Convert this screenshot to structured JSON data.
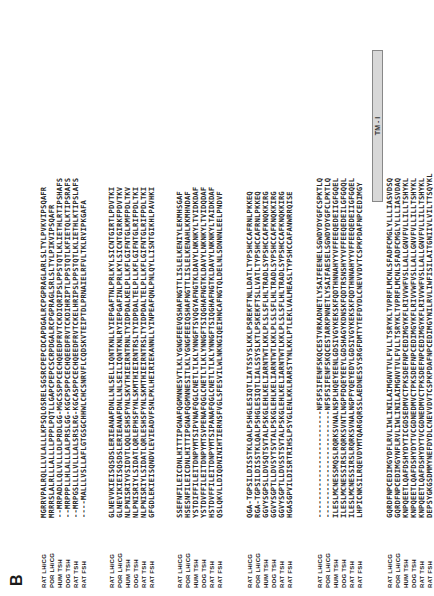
{
  "figure": {
    "panel_label": "B",
    "species": [
      "RAT LH/CG",
      "POR LH/CG",
      "HUM TSH",
      "DOG TSH",
      "RAT TSH",
      "RAT FSH"
    ],
    "annotation": {
      "tm1_label": "TM - I"
    },
    "blocks": [
      {
        "rows": [
          "MGRRVPALRQLLLVLALLLKPSQLOSRELSGSRCPEPCDCAPDGALRCPGPRAGLARLSLTYLPVKVIPSQAFR",
          "MRRRSLALRLLLALLLLPPPLPQTLLGAPCPEPCSCRPDGALRCPGPRAGLSRLSLTYLPIKVIPSQAFR",
          "--MRPADLLQLVLLLDLPRDLGG-MGCSSPPCECHQEEDFRVTCKDIQRIPSLPPSTQTLKLIETHLRTIPSHAFS",
          "--MRPPPLLHLALLLALPRSLGG-KGCPSPPCECHQEEDFRVTCKDIHRIPTLPPSTQTLKFIETQLKTIPSRAFS",
          "--MRPGSLLLLVLLLALSRSLRG-KGCASPPCECHQEEDFRVTCKELHRIPSLPPSTQTLKLIETHLKTIPSLAFS",
          "----MALLLVSLLAFLGTGSGCHHWLCHCSNRVFLCQDSKVTEIPTDLPRNAIELRFVLTKLRVIPKGAFA"
        ]
      },
      {
        "rows": [
          "GLNEVVKIEISQSDSLERIEANAFDNLLNLSELLIQNTKNLLYIEPGAFTNLPRLKYLSICNTGIRTLPDVTKI",
          "GLNEVIKIEISQSDSLERIEANAFDNLLNLSEILIQNTKNLRYIEPGAFINLPRLKYLSICNTGIRKFPDVTKV",
          "NLPNISRIYVSIDVTLQQLESHSFYNLSKVTHIEIRNTRNLTYIDPDALKELPLLKFLGIFNTGLKMFPDLTKV",
          "NLPNISRIYLSIDATLQRLEPHSFYNLSKMTHIEIRNTRSLTYIDPDALTELPLLKFLGIFNTGLRIFPDLTKI",
          "NLPNISRIYLSIDATLQRLESHSFYNLSKMTHIEIRNTRSLTYIDPDALTELPLLKFLGIFNTGLRIFPDLTKI",
          "GFGDLEKIEISQNDVLEVIEADVFSNLPKLHEIRIEKANNLLYINPEAFQNLPNLQYLLISNTGIKHLPAVHKI"
        ]
      },
      {
        "rows": [
          "SSEFNFILEICDNLHITTIPGNAFQGMNNESVTLKLYGNGFEEVQSHAFNGTTLISLELKENIYLEKMHSGAF",
          "HSESNFILEICDNLHITTIPGNAFQGMNNESITLKLYGNGFEEIQSHAFNGTTLISLELKENAHLKKMHNDAF",
          "YSTDIFFILEITDNPYMTSIPVNAFQGLCNETLTLKLYNNGFTSVQGYAFNGTKLDAVYLNKNKYLTVIDKDAF",
          "YSTDVFFILEITDNPYMTSVPENAFQGLCNETLTLKLYNNGFTSIQGHAFNGTKLDAVYLNKNKYLTVIDQDAF",
          "HSTDVFFILEITDNPYMTSIPANAFQGLCNETLTLKLYNNGFTSIQGHAFNGTKLDAVYLNKNKYLTAIDKDAF",
          "QSLQKVLLDIQDNINIHTIERNSFVGLSFESVILWLNKNGIQEIHNCAFNGTQLDELNLSDNNNLEELPNDVF"
        ]
      },
      {
        "rows": [
          "QGA-TGPSILDISSTKLQALPSHGLESIQTLIATSSYSLKKLPSREKFTNLLDATLTYPSHCCAFRNLPKKEQ",
          "RGA-TGPSILDISSTKLQALPSHGLESIQTLIALSSYSLKTLPSKEKFTSLLVATLTYPSHCCAFRNLPKKEQ",
          "GGVYSGPSLLDVSQTSVTALPSKGLEHLKELIARNTWTLKKLPLSLSFLHLTRADLSYPSHCCAFKNQKKIRG",
          "GGVYSGPTLLDVSYTSVTALPSKGLEHLKELIARNTWTLKKLPLSLSFLHLTRADLSYPSHCCAFKNQKKIRG",
          "GGVYSGPTLLDVSSTSVTALPSKGLEHLKELIARNTWTLKKLPLSLSFLHLTRADLSYPSHCCAFKNQKKIRG",
          "HGASGPVILDISRTRIHSLPSYGLENLKKLRARSTYNLKKLPTLEKLVALMEASLTYPSHCCAFANWRRQISE"
        ]
      },
      {
        "rows": [
          "------------------------NFSFSIFENFSKQCESTVRKADNETLYSAIFEENELSGWDYDYGFCSPKTLQ",
          "------------------------NFSFSIFENFSKQCESTARKPNNETLYSAIFAESELSGWDYDYGFCLPKTLQ",
          "ILESLMCNESSMQSLRQRKSVNALNSPLHQEYEENLGDSIVGYKEKSKFQDTHNNAHYYVFFEEQEDEIIGFGQEL",
          "ILESLMCNESSIRSLRQRKSVNTLNGPFDQEYEEYLGDSHAGYKDNSKFQDTRSNSHYYVFFEEQEDEILGFGQQL",
          "ILESLMCNESSIRSLRQRKSVNALNGPFYQEYEDYLGDSIVGYKEKSKFQDTHNNAHYYVFFEEQEDEIIGFGQEL",
          "LHPICNKSILRQEVDYMTQARGQRSSLAEDNESSYSRGFDMTYTEFDYDLCNEVVDVTCSPKPDAFNPCEDIMGY"
        ]
      },
      {
        "rows": [
          "GQRDFNPCEDIMGYDFLRVLIWLINILAIMGNVTVLFVLLTSRYKLTVPRFLMCNLSFADFCMGLYLLLIASVDSQ",
          "GQRDFNPCEDIMGYNFLRVLIWLINILAIMGNVTVLFVLLTSRYKLTVPRFLMCNLSFADFCMGLYLLLIASVDAQ",
          "KNPQEETLQAFDSHYDYTICGDSEDMVCTPKSDEFNPCEDIMGYKFLRIVVWFVSLLALLGNVFVLLILLTSHYKL",
          "KNPQEETLQAFDSHYDYTVCGDNEDMVCTPKSDEFNPCEDIMGYKFLRIVVWFVSLLALLGNVFVLLILLTSHYKL",
          "KNPQEETLQAFDSHYDYTVCGDNEDMVCTPKSDEFNPCEDIMGYKFLRIVVWFVSLLALLGNVFVLLILLTSHYKL",
          "DEPSYGKGSDMMYNEFDYDLCNEVVDVTCSPKPDAFNPCEDIMGYNILRVLIWFISILAITGNIIVLVILTTSQYKL"
        ]
      }
    ]
  }
}
